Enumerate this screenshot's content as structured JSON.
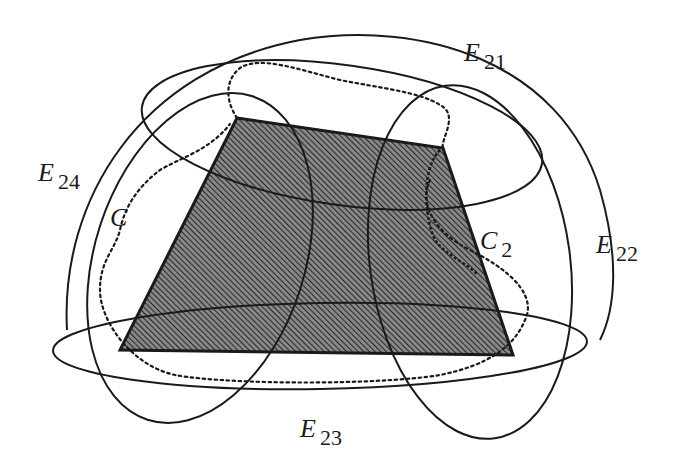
{
  "figure": {
    "colors": {
      "stroke": "#1a1a1a",
      "fill_hatch": "#4a4a4a",
      "background": "#ffffff"
    }
  },
  "labels": {
    "e21": {
      "main": "E",
      "sub": "21"
    },
    "e22": {
      "main": "E",
      "sub": "22"
    },
    "e23": {
      "main": "E",
      "sub": "23"
    },
    "e24": {
      "main": "E",
      "sub": "24"
    },
    "c": {
      "main": "C"
    },
    "c2": {
      "main": "C",
      "sub": "2"
    }
  },
  "shapes": {
    "region": {
      "type": "quadrilateral",
      "vertices": [
        [
          237,
          118
        ],
        [
          443,
          148
        ],
        [
          513,
          355
        ],
        [
          120,
          350
        ]
      ],
      "fill": "hatched"
    },
    "ellipses": [
      "E21",
      "E22",
      "E23",
      "E24"
    ],
    "outer_dome": "solid",
    "curve_c": "dotted"
  }
}
